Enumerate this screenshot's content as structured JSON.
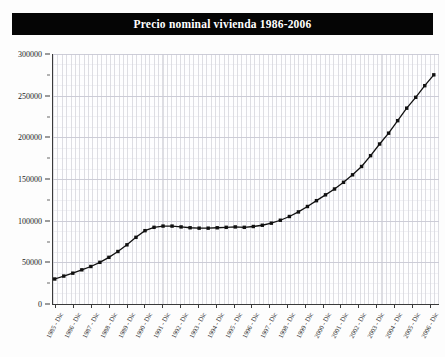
{
  "chart": {
    "title": "Precio nominal vivienda 1986-2006",
    "title_bg_color": "#050505",
    "title_text_color": "#ffffff"
  },
  "chart_data": {
    "type": "line",
    "title": "Precio nominal vivienda 1986-2006",
    "subtitle": "",
    "xlabel": "",
    "ylabel": "",
    "grid": true,
    "legend": "none",
    "marker": "filled-square",
    "line_color": "#111111",
    "marker_color": "#111111",
    "ylim": [
      0,
      300000
    ],
    "ytick_step": 50000,
    "ytick_labels": [
      "0",
      "50000",
      "100000",
      "150000",
      "200000",
      "250000",
      "300000"
    ],
    "ytick_values": [
      0,
      50000,
      100000,
      150000,
      200000,
      250000,
      300000
    ],
    "xtick_labels": [
      "1985 - Dic",
      "1986 - Dic",
      "1987 - Dic",
      "1988 - Dic",
      "1989 - Dic",
      "1990 - Dic",
      "1991 - Dic",
      "1992 - Dic",
      "1993 - Dic",
      "1994 - Dic",
      "1995 - Dic",
      "1996 - Dic",
      "1997 - Dic",
      "1998 - Dic",
      "1999 - Dic",
      "2000 - Dic",
      "2001 - Dic",
      "2002 - Dic",
      "2003 - Dic",
      "2004 - Dic",
      "2005 - Dic",
      "2006 - Dic"
    ],
    "series": [
      {
        "name": "Precio nominal vivienda",
        "x": [
          "1985 - Dic",
          "1986 - Jun",
          "1986 - Dic",
          "1987 - Jun",
          "1987 - Dic",
          "1988 - Jun",
          "1988 - Dic",
          "1989 - Jun",
          "1989 - Dic",
          "1990 - Jun",
          "1990 - Dic",
          "1991 - Jun",
          "1991 - Dic",
          "1992 - Jun",
          "1992 - Dic",
          "1993 - Jun",
          "1993 - Dic",
          "1994 - Jun",
          "1994 - Dic",
          "1995 - Jun",
          "1995 - Dic",
          "1996 - Jun",
          "1996 - Dic",
          "1997 - Jun",
          "1997 - Dic",
          "1998 - Jun",
          "1998 - Dic",
          "1999 - Jun",
          "1999 - Dic",
          "2000 - Jun",
          "2000 - Dic",
          "2001 - Jun",
          "2001 - Dic",
          "2002 - Jun",
          "2002 - Dic",
          "2003 - Jun",
          "2003 - Dic",
          "2004 - Jun",
          "2004 - Dic",
          "2005 - Jun",
          "2005 - Dic",
          "2006 - Jun",
          "2006 - Dic"
        ],
        "values": [
          30000,
          33500,
          37000,
          41000,
          45000,
          50000,
          56000,
          63000,
          71000,
          80000,
          88000,
          92000,
          93500,
          93500,
          92500,
          91500,
          91000,
          91000,
          91500,
          92000,
          92500,
          92000,
          93000,
          94500,
          97000,
          100500,
          105000,
          110500,
          117000,
          124000,
          131000,
          138000,
          146000,
          155000,
          165000,
          178000,
          192000,
          205000,
          220000,
          235000,
          248000,
          262000,
          275000
        ]
      }
    ]
  }
}
